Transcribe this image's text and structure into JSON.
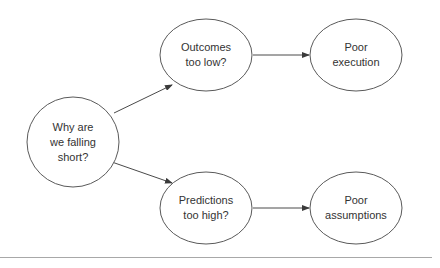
{
  "diagram": {
    "nodes": [
      {
        "id": "root",
        "lines": [
          "Why are",
          "we falling",
          "short?"
        ]
      },
      {
        "id": "outcomes",
        "lines": [
          "Outcomes",
          "too low?"
        ]
      },
      {
        "id": "execution",
        "lines": [
          "Poor",
          "execution"
        ]
      },
      {
        "id": "predictions",
        "lines": [
          "Predictions",
          "too high?"
        ]
      },
      {
        "id": "assumptions",
        "lines": [
          "Poor",
          "assumptions"
        ]
      }
    ],
    "edges": [
      {
        "from": "root",
        "to": "outcomes"
      },
      {
        "from": "outcomes",
        "to": "execution"
      },
      {
        "from": "root",
        "to": "predictions"
      },
      {
        "from": "predictions",
        "to": "assumptions"
      }
    ],
    "colors": {
      "stroke": "#5a5a5a",
      "text": "#333333",
      "rule": "#a8a8a8"
    }
  }
}
